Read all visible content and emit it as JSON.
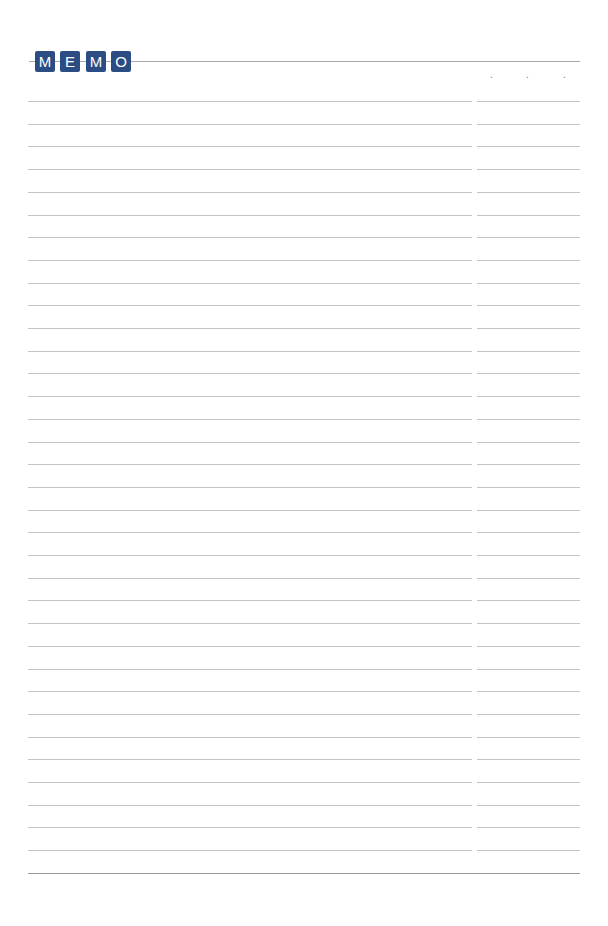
{
  "header": {
    "title_letters": [
      "M",
      "E",
      "M",
      "O"
    ],
    "tile_color": "#2c4d84",
    "date_separators": [
      ".",
      ".",
      "."
    ]
  },
  "lines": {
    "ruled_row_count": 34,
    "first_row_y": 101,
    "row_spacing": 22.7,
    "main_column_width": 444,
    "side_column_width": 103,
    "bottom_rule": true
  }
}
